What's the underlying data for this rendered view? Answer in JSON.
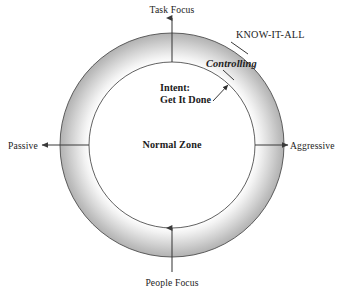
{
  "diagram": {
    "type": "annulus-quadrant-diagram",
    "background_color": "#ffffff",
    "ring": {
      "center_x": 172,
      "center_y": 145,
      "outer_radius": 112,
      "inner_radius": 83,
      "outline_color": "#4a4a4a",
      "gradient_inner_color": "#ffffff",
      "gradient_outer_color": "#b4b4b4"
    },
    "axes": [
      {
        "name": "task-focus",
        "label": "Task Focus",
        "direction": "up"
      },
      {
        "name": "people-focus",
        "label": "People Focus",
        "direction": "down"
      },
      {
        "name": "passive",
        "label": "Passive",
        "direction": "left"
      },
      {
        "name": "aggressive",
        "label": "Aggressive",
        "direction": "right"
      }
    ],
    "center_label": "Normal Zone",
    "callouts": [
      {
        "name": "know-it-all",
        "label": "KNOW-IT-ALL",
        "style": "caps-serif"
      },
      {
        "name": "controlling",
        "label": "Controlling",
        "style": "bold-italic-serif"
      },
      {
        "name": "intent",
        "label_line_1": "Intent:",
        "label_line_2": "Get It Done",
        "style": "bold-serif"
      }
    ],
    "line_color": "#3a3a3a"
  }
}
